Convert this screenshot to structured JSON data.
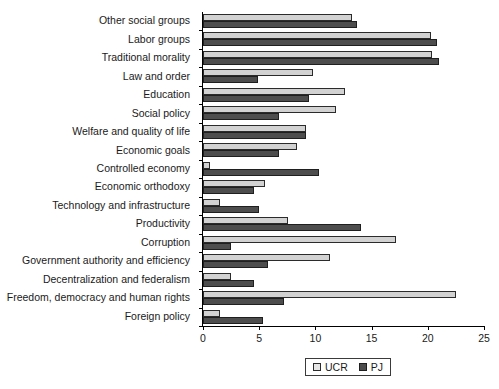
{
  "chart_data": {
    "type": "bar",
    "orientation": "horizontal",
    "title": "",
    "subtitle": "",
    "xlabel": "",
    "ylabel": "",
    "xlim": [
      0,
      25
    ],
    "xticks": [
      0,
      5,
      10,
      15,
      20,
      25
    ],
    "grid": false,
    "legend_position": "bottom-center",
    "categories": [
      "Other social groups",
      "Labor groups",
      "Traditional morality",
      "Law and order",
      "Education",
      "Social policy",
      "Welfare and quality of life",
      "Economic goals",
      "Controlled economy",
      "Economic orthodoxy",
      "Technology and infrastructure",
      "Productivity",
      "Corruption",
      "Government authority and efficiency",
      "Decentralization and federalism",
      "Freedom, democracy and human rights",
      "Foreign policy"
    ],
    "series": [
      {
        "name": "UCR",
        "color": "#d2d2d2",
        "values": [
          13.3,
          20.3,
          20.4,
          9.8,
          12.6,
          11.8,
          9.2,
          8.4,
          0.6,
          5.5,
          1.5,
          7.6,
          17.2,
          11.3,
          2.5,
          22.5,
          1.5
        ]
      },
      {
        "name": "PJ",
        "color": "#4d4d4d",
        "values": [
          13.7,
          20.8,
          21.0,
          4.9,
          9.4,
          6.8,
          9.2,
          6.8,
          10.3,
          4.5,
          5.0,
          14.1,
          2.5,
          5.8,
          4.5,
          7.2,
          5.3
        ]
      }
    ]
  },
  "legend": {
    "items": [
      {
        "label": "UCR",
        "swatch": "light-gray-swatch"
      },
      {
        "label": "PJ",
        "swatch": "dark-gray-swatch"
      }
    ]
  }
}
